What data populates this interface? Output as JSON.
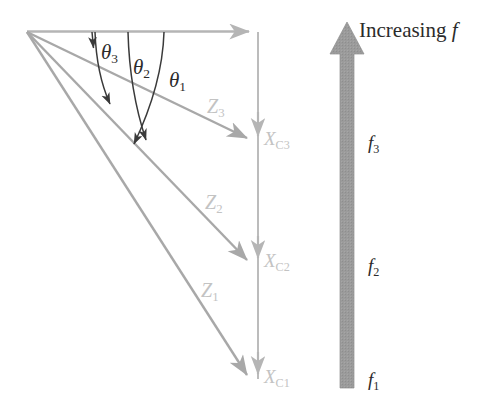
{
  "figure": {
    "type": "geometry-diagram"
  },
  "colors": {
    "ray": "#a8a8a8",
    "axis": "#b5b5b5",
    "arc": "#3a3a3a",
    "label_gray": "#c3c3c3",
    "label_dark": "#2b2b2b",
    "arrow_fill": "#9b9b9b",
    "background": "#ffffff"
  },
  "angles": [
    {
      "id": "theta1",
      "symbol": "θ",
      "sub": "1"
    },
    {
      "id": "theta2",
      "symbol": "θ",
      "sub": "2"
    },
    {
      "id": "theta3",
      "symbol": "θ",
      "sub": "3"
    }
  ],
  "rays": [
    {
      "id": "Z1",
      "symbol": "Z",
      "sub": "1"
    },
    {
      "id": "Z2",
      "symbol": "Z",
      "sub": "2"
    },
    {
      "id": "Z3",
      "symbol": "Z",
      "sub": "3"
    }
  ],
  "cross_range_points": [
    {
      "id": "XC1",
      "symbol": "X",
      "sub": "C1"
    },
    {
      "id": "XC2",
      "symbol": "X",
      "sub": "C2"
    },
    {
      "id": "XC3",
      "symbol": "X",
      "sub": "C3"
    }
  ],
  "frequency_axis": {
    "title_text": "Increasing ",
    "title_symbol": "f",
    "ticks": [
      {
        "id": "f3",
        "symbol": "f",
        "sub": "3"
      },
      {
        "id": "f2",
        "symbol": "f",
        "sub": "2"
      },
      {
        "id": "f1",
        "symbol": "f",
        "sub": "1"
      }
    ]
  }
}
